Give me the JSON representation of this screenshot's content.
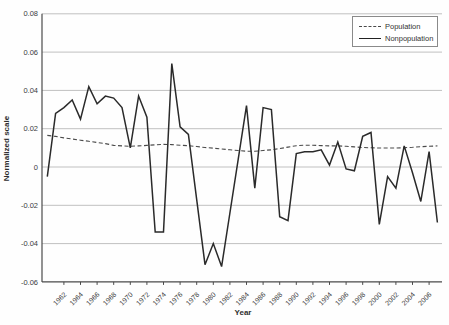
{
  "chart_data": {
    "type": "line",
    "xlabel": "Year",
    "ylabel": "Normalized scale",
    "x": [
      1960,
      1961,
      1962,
      1963,
      1964,
      1965,
      1966,
      1967,
      1968,
      1969,
      1970,
      1971,
      1972,
      1973,
      1974,
      1975,
      1976,
      1977,
      1978,
      1979,
      1980,
      1981,
      1982,
      1983,
      1984,
      1985,
      1986,
      1987,
      1988,
      1989,
      1990,
      1991,
      1992,
      1993,
      1994,
      1995,
      1996,
      1997,
      1998,
      1999,
      2000,
      2001,
      2002,
      2003,
      2004,
      2005,
      2006,
      2007
    ],
    "series": [
      {
        "name": "Population",
        "style": "dashed",
        "color": "#4a4a4a",
        "values": [
          0.0165,
          0.016,
          0.0152,
          0.0146,
          0.014,
          0.0134,
          0.0128,
          0.0122,
          0.0113,
          0.011,
          0.0108,
          0.011,
          0.0113,
          0.0116,
          0.0118,
          0.0117,
          0.0114,
          0.0111,
          0.0107,
          0.0102,
          0.0098,
          0.0094,
          0.009,
          0.0086,
          0.0082,
          0.0082,
          0.0086,
          0.009,
          0.0096,
          0.0104,
          0.0111,
          0.0114,
          0.0114,
          0.0112,
          0.011,
          0.011,
          0.0108,
          0.0105,
          0.0102,
          0.01,
          0.0099,
          0.0099,
          0.0099,
          0.0101,
          0.0103,
          0.0106,
          0.0108,
          0.011
        ]
      },
      {
        "name": "Nonpopulation",
        "style": "solid",
        "color": "#2a2a2a",
        "values": [
          -0.005,
          0.028,
          0.031,
          0.035,
          0.025,
          0.042,
          0.033,
          0.037,
          0.036,
          0.031,
          0.01,
          0.037,
          0.026,
          -0.034,
          -0.034,
          0.054,
          0.021,
          0.017,
          -0.017,
          -0.051,
          -0.04,
          -0.052,
          -0.024,
          0.004,
          0.032,
          -0.011,
          0.031,
          0.03,
          -0.026,
          -0.028,
          0.007,
          0.008,
          0.008,
          0.009,
          0.001,
          0.013,
          -0.001,
          -0.002,
          0.016,
          0.018,
          -0.03,
          -0.005,
          -0.011,
          0.011,
          -0.003,
          -0.018,
          0.008,
          -0.029
        ]
      }
    ],
    "ylim": [
      -0.06,
      0.08
    ],
    "ytick_step": 0.02,
    "xticks": [
      1962,
      1964,
      1966,
      1968,
      1970,
      1972,
      1974,
      1976,
      1978,
      1980,
      1982,
      1984,
      1986,
      1988,
      1990,
      1992,
      1994,
      1996,
      1998,
      2000,
      2002,
      2004,
      2006
    ],
    "grid": "horizontal",
    "legend_position": "top-right"
  },
  "colors": {
    "background": "#fefefe",
    "gridline": "#c0c0c0",
    "axis": "#4a4a4a",
    "tick_text": "#3c3c3c"
  }
}
